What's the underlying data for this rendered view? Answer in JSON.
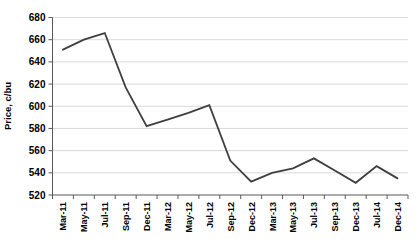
{
  "chart_data": {
    "type": "line",
    "title": "",
    "xlabel": "",
    "ylabel": "Price, c/bu",
    "categories": [
      "Mar-11",
      "May-11",
      "Jul-11",
      "Sep-11",
      "Dec-11",
      "Mar-12",
      "May-12",
      "Jul-12",
      "Sep-12",
      "Dec-12",
      "Mar-13",
      "May-13",
      "Jul-13",
      "Sep-13",
      "Dec-13",
      "Jul-14",
      "Dec-14"
    ],
    "values": [
      651,
      660,
      666,
      617,
      582,
      588,
      594,
      601,
      551,
      532,
      540,
      544,
      553,
      542,
      531,
      546,
      535
    ],
    "ylim": [
      520,
      680
    ],
    "yticks": [
      520,
      540,
      560,
      580,
      600,
      620,
      640,
      660,
      680
    ],
    "grid": "horizontal",
    "legend": "none",
    "colors": {
      "line": "#3f3f3f",
      "gridline": "#d9d9d9",
      "axis": "#595959",
      "text": "#000000",
      "background": "#ffffff"
    }
  }
}
